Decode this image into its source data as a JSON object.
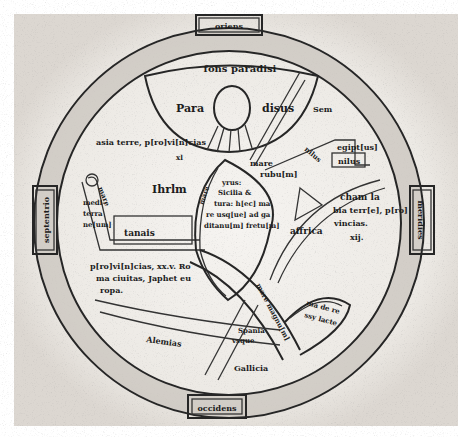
{
  "map": {
    "title": "fons paradisi",
    "cardinal_labels": {
      "east": "oriens",
      "west": "occidens",
      "north": "septentrio",
      "south": "meridies"
    },
    "paradise": {
      "left": "Para",
      "right": "disus",
      "sem": "Sem"
    },
    "asia": {
      "line1": "asia terre, p[ro]vi[n]cias",
      "line2": "xl"
    },
    "egypt": {
      "egiptus": "egipt[us]",
      "nilus_box": "nilus",
      "nilus_river": "nilus"
    },
    "mare_rubrum": {
      "line1": "mare",
      "line2": "rubu[m]"
    },
    "ihrlm": "Ihrlm",
    "mare_mediterraneum_text": [
      "mare",
      "medi-",
      "terra",
      "ne[um]"
    ],
    "tanais": "tanais",
    "center_island": {
      "label": "mare",
      "lines": [
        "yrus:",
        "Sicilia &",
        "tura: h[ec] ma",
        "re usq[ue] ad ga",
        "ditanu[m] fretu[m]"
      ]
    },
    "cham": {
      "line1": "cham la",
      "line2": "bia terr[e], p[ro]",
      "line3": "vincias.",
      "line4": "xij."
    },
    "africa": "affrica",
    "europa": {
      "line1": "p[ro]vi[n]cias, xx.v. Ro",
      "line2": "ma ciuitas, Japhet eu",
      "line3": "ropa."
    },
    "mare_magnum": "mare magnu[m]",
    "rubrum_tail": {
      "line1": "ma de re",
      "line2": "ssy lacte"
    },
    "hispania": {
      "line1": "Spania",
      "line2": "vsque"
    },
    "alemannia": "Alemias",
    "gallicia": "Gallicia"
  },
  "colors": {
    "ink": "#262626",
    "parchment": "#f3f1ee",
    "shadow": "#b8b3ad",
    "paper": "#ffffff"
  }
}
